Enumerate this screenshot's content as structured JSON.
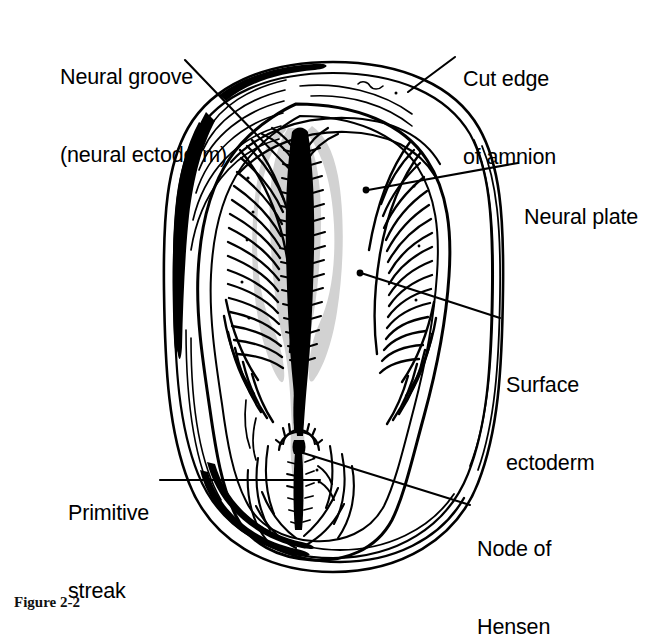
{
  "figure": {
    "caption": "Figure 2-2",
    "background_color": "#ffffff",
    "ink_color": "#000000",
    "shade_color": "#d2d2d2"
  },
  "labels": {
    "neural_groove": {
      "line1": "Neural groove",
      "line2": "(neural ectoderm)",
      "x": 60,
      "y": 12,
      "align": "left"
    },
    "cut_edge": {
      "line1": "Cut edge",
      "line2": "of amnion",
      "x": 463,
      "y": 14,
      "align": "left"
    },
    "neural_plate": {
      "line1": "Neural plate",
      "x": 524,
      "y": 155,
      "align": "left"
    },
    "surface_ectoderm": {
      "line1": "Surface",
      "line2": "ectoderm",
      "x": 506,
      "y": 323,
      "align": "left"
    },
    "primitive_streak": {
      "line1": "Primitive",
      "line2": "streak",
      "x": 68,
      "y": 450,
      "align": "left"
    },
    "node_of_hensen": {
      "line1": "Node of",
      "line2": "Hensen",
      "x": 477,
      "y": 487,
      "align": "left"
    }
  },
  "structures": [
    {
      "name": "amnion-outer-edge",
      "description": "Thick cut edge of the amnion forming the outer oval ring"
    },
    {
      "name": "embryonic-disc",
      "description": "Inner pear-shaped embryonic disc"
    },
    {
      "name": "neural-fold-left",
      "description": "Left neural fold with dense hatching"
    },
    {
      "name": "neural-fold-right",
      "description": "Right neural fold with dense hatching"
    },
    {
      "name": "neural-groove",
      "description": "Dark midline groove with grey neural ectoderm shading"
    },
    {
      "name": "neural-plate",
      "description": "Broad un-hatched plate region lateral to the groove"
    },
    {
      "name": "primitive-streak",
      "description": "Vertical midline streak in the caudal disc"
    },
    {
      "name": "node-of-hensen",
      "description": "Crescent shaped node capping the primitive streak"
    }
  ]
}
